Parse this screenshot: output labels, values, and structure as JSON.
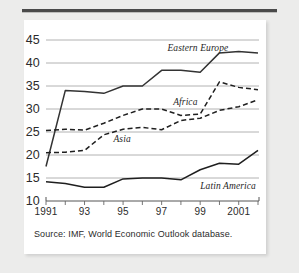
{
  "figure": {
    "source_note": "Source: IMF, World Economic Outlook database.",
    "background_color": "#ececeb",
    "panel_color": "#ffffff",
    "rule_color": "#4a4a4a"
  },
  "chart_data": {
    "type": "line",
    "title": "",
    "subtitle": "",
    "xlabel": "",
    "ylabel": "",
    "xlim": [
      1991,
      2002
    ],
    "ylim": [
      10,
      45
    ],
    "yticks": [
      10,
      15,
      20,
      25,
      30,
      35,
      40,
      45
    ],
    "ytick_labels": [
      "10",
      "15",
      "20",
      "25",
      "30",
      "35",
      "40",
      "45"
    ],
    "xticks": [
      1991,
      1992,
      1993,
      1994,
      1995,
      1996,
      1997,
      1998,
      1999,
      2000,
      2001,
      2002
    ],
    "xtick_labels": [
      "1991",
      "",
      "93",
      "",
      "95",
      "",
      "97",
      "",
      "99",
      "",
      "2001",
      ""
    ],
    "grid": "horizontal",
    "grid_color": "#a9a9a9",
    "legend_position": "inline-labels",
    "x": [
      1991,
      1992,
      1993,
      1994,
      1995,
      1996,
      1997,
      1998,
      1999,
      2000,
      2001,
      2002
    ],
    "series": [
      {
        "name": "Eastern Europe",
        "style": "solid",
        "color": "#333333",
        "label_x": 1997.3,
        "label_y": 43.0,
        "values": [
          17.5,
          34.0,
          33.8,
          33.4,
          35.0,
          35.0,
          38.4,
          38.4,
          38.0,
          42.2,
          42.5,
          42.2
        ]
      },
      {
        "name": "Africa",
        "style": "dashed",
        "color": "#1f1f1f",
        "label_x": 1997.6,
        "label_y": 31.4,
        "values": [
          25.3,
          25.6,
          25.4,
          26.9,
          28.6,
          30.0,
          30.0,
          28.6,
          28.9,
          35.9,
          34.7,
          34.2
        ]
      },
      {
        "name": "Asia",
        "style": "dashed",
        "color": "#1f1f1f",
        "label_x": 1994.5,
        "label_y": 23.2,
        "values": [
          20.5,
          20.6,
          21.0,
          24.4,
          25.6,
          26.0,
          25.5,
          27.5,
          28.0,
          29.7,
          30.5,
          32.0
        ]
      },
      {
        "name": "Latin America",
        "style": "solid",
        "color": "#1f1f1f",
        "label_x": 1999.0,
        "label_y": 13.1,
        "values": [
          14.2,
          13.8,
          13.0,
          13.0,
          14.8,
          15.0,
          15.0,
          14.6,
          16.8,
          18.2,
          18.0,
          21.0
        ]
      }
    ]
  }
}
